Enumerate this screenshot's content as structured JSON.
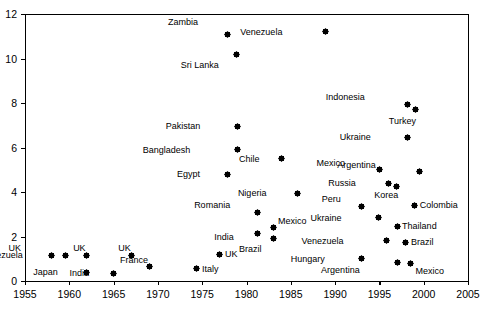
{
  "chart_data": {
    "type": "scatter",
    "title": "",
    "xlabel": "",
    "ylabel": "",
    "xlim": [
      1955,
      2005
    ],
    "ylim": [
      0,
      12
    ],
    "xticks": [
      1955,
      1960,
      1965,
      1970,
      1975,
      1980,
      1985,
      1990,
      1995,
      2000,
      2005
    ],
    "yticks": [
      0,
      2,
      4,
      6,
      8,
      10,
      12
    ],
    "grid": false,
    "legend": "none",
    "marker_style": "filled-diamond",
    "marker_color": "#000000",
    "points": [
      {
        "label": "Zambia",
        "x": 1977.8,
        "y": 11.1,
        "lx": -34,
        "ly": -16
      },
      {
        "label": "Venezuela",
        "x": 1988.9,
        "y": 11.2,
        "lx": -48,
        "ly": -4
      },
      {
        "label": "Sri Lanka",
        "x": 1978.9,
        "y": 10.2,
        "lx": -23,
        "ly": 7
      },
      {
        "label": "Indonesia",
        "x": 1998.2,
        "y": 7.95,
        "lx": -48,
        "ly": -11
      },
      {
        "label": "Turkey",
        "x": 1999.1,
        "y": 7.7,
        "lx": -5,
        "ly": 7
      },
      {
        "label": "Pakistan",
        "x": 1979.0,
        "y": 6.95,
        "lx": -42,
        "ly": -4
      },
      {
        "label": "Ukraine",
        "x": 1998.2,
        "y": 6.45,
        "lx": -42,
        "ly": -4
      },
      {
        "label": "Bangladesh",
        "x": 1979.0,
        "y": 5.9,
        "lx": -52,
        "ly": -4
      },
      {
        "label": "Chile",
        "x": 1984.0,
        "y": 5.5,
        "lx": -27,
        "ly": -4
      },
      {
        "label": "Argentina",
        "x": 1999.5,
        "y": 4.9,
        "lx": -48,
        "ly": -11
      },
      {
        "label": "Mexico",
        "x": 1995.0,
        "y": 5.0,
        "lx": -39,
        "ly": -11
      },
      {
        "label": "Egypt",
        "x": 1977.8,
        "y": 4.8,
        "lx": -32,
        "ly": -4
      },
      {
        "label": "Russia",
        "x": 1996.0,
        "y": 4.4,
        "lx": -37,
        "ly": -4
      },
      {
        "label": "Korea",
        "x": 1996.9,
        "y": 4.25,
        "lx": -3,
        "ly": 5
      },
      {
        "label": "Nigeria",
        "x": 1985.8,
        "y": 3.95,
        "lx": -36,
        "ly": -4
      },
      {
        "label": "Colombia",
        "x": 1999.0,
        "y": 3.4,
        "lx": 5,
        "ly": -4
      },
      {
        "label": "Peru",
        "x": 1993.0,
        "y": 3.35,
        "lx": -26,
        "ly": -11
      },
      {
        "label": "Romania",
        "x": 1981.2,
        "y": 3.1,
        "lx": -32,
        "ly": -11
      },
      {
        "label": "Ukraine",
        "x": 1994.9,
        "y": 2.85,
        "lx": -42,
        "ly": -4
      },
      {
        "label": "Thailand",
        "x": 1997.0,
        "y": 2.45,
        "lx": 5,
        "ly": -4
      },
      {
        "label": "Mexico",
        "x": 1983.0,
        "y": 2.4,
        "lx": 5,
        "ly": -11
      },
      {
        "label": "India",
        "x": 1981.2,
        "y": 2.15,
        "lx": -28,
        "ly": 0
      },
      {
        "label": "Venezuela",
        "x": 1995.8,
        "y": 1.8,
        "lx": -48,
        "ly": -4
      },
      {
        "label": "Brazil",
        "x": 1998.0,
        "y": 1.75,
        "lx": 5,
        "ly": -4
      },
      {
        "label": "Brazil",
        "x": 1983.1,
        "y": 1.9,
        "lx": -17,
        "ly": 6
      },
      {
        "label": "UK",
        "x": 1958.0,
        "y": 1.15,
        "lx": -35,
        "ly": -11
      },
      {
        "label": "Venezuela",
        "x": 1959.6,
        "y": 1.15,
        "lx": -48,
        "ly": -4
      },
      {
        "label": "UK",
        "x": 1961.9,
        "y": 1.15,
        "lx": -5,
        "ly": -11
      },
      {
        "label": "UK",
        "x": 1967.0,
        "y": 1.15,
        "lx": -5,
        "ly": -11
      },
      {
        "label": "UK",
        "x": 1977.0,
        "y": 1.2,
        "lx": 5,
        "ly": -4
      },
      {
        "label": "Japan",
        "x": 1961.9,
        "y": 0.4,
        "lx": -33,
        "ly": -4
      },
      {
        "label": "India",
        "x": 1965.0,
        "y": 0.35,
        "lx": -29,
        "ly": -4
      },
      {
        "label": "France",
        "x": 1969.0,
        "y": 0.65,
        "lx": -6,
        "ly": -11
      },
      {
        "label": "Italy",
        "x": 1974.4,
        "y": 0.55,
        "lx": 5,
        "ly": -4
      },
      {
        "label": "Hungary",
        "x": 1993.0,
        "y": 1.0,
        "lx": -42,
        "ly": -4
      },
      {
        "label": "Argentina",
        "x": 1997.0,
        "y": 0.85,
        "lx": -42,
        "ly": 4
      },
      {
        "label": "Mexico",
        "x": 1998.5,
        "y": 0.8,
        "lx": 5,
        "ly": 4
      }
    ]
  },
  "axes": {
    "x_tick_labels": [
      "1955",
      "1960",
      "1965",
      "1970",
      "1975",
      "1980",
      "1985",
      "1990",
      "1995",
      "2000",
      "2005"
    ],
    "y_tick_labels": [
      "0",
      "2",
      "4",
      "6",
      "8",
      "10",
      "12"
    ]
  }
}
